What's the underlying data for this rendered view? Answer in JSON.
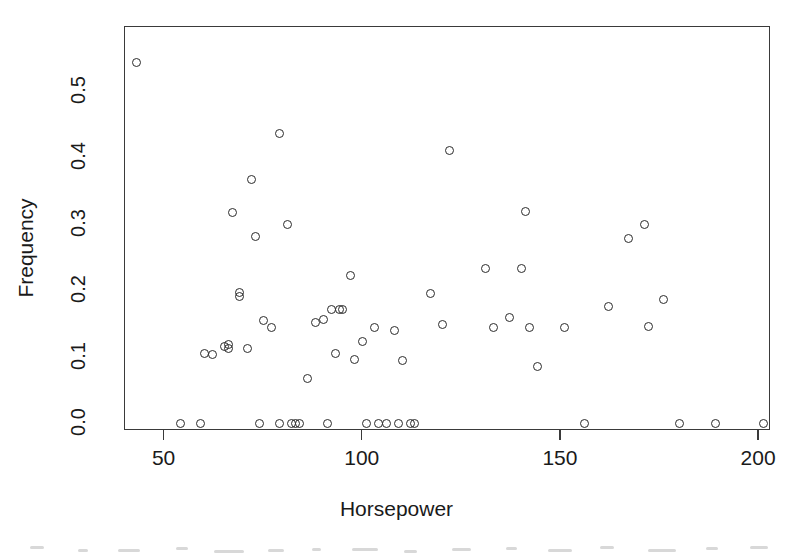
{
  "chart_data": {
    "type": "scatter",
    "title": "",
    "xlabel": "Horsepower",
    "ylabel": "Frequency",
    "xlim": [
      40,
      203
    ],
    "ylim": [
      -0.012,
      0.596
    ],
    "xticks": [
      50,
      100,
      150,
      200
    ],
    "xtick_labels": [
      "50",
      "100",
      "150",
      "200"
    ],
    "yticks": [
      0.0,
      0.1,
      0.2,
      0.3,
      0.4,
      0.5
    ],
    "ytick_labels": [
      "0.0",
      "0.1",
      "0.2",
      "0.3",
      "0.4",
      "0.5"
    ],
    "grid": false,
    "legend": null,
    "marker": "open-circle",
    "marker_color": "#2b2b2b",
    "series": [
      {
        "name": "Horsepower vs Frequency",
        "points": [
          [
            43,
            0.543
          ],
          [
            54,
            0.0
          ],
          [
            59,
            0.0
          ],
          [
            60,
            0.105
          ],
          [
            62,
            0.103
          ],
          [
            65,
            0.115
          ],
          [
            66,
            0.118
          ],
          [
            66,
            0.112
          ],
          [
            67,
            0.317
          ],
          [
            69,
            0.197
          ],
          [
            69,
            0.191
          ],
          [
            71,
            0.112
          ],
          [
            72,
            0.367
          ],
          [
            73,
            0.281
          ],
          [
            74,
            0.0
          ],
          [
            75,
            0.155
          ],
          [
            77,
            0.144
          ],
          [
            79,
            0.435
          ],
          [
            79,
            0.0
          ],
          [
            81,
            0.299
          ],
          [
            82,
            0.0
          ],
          [
            83,
            0.0
          ],
          [
            84,
            0.0
          ],
          [
            86,
            0.067
          ],
          [
            88,
            0.151
          ],
          [
            90,
            0.156
          ],
          [
            91,
            0.0
          ],
          [
            92,
            0.171
          ],
          [
            93,
            0.104
          ],
          [
            94,
            0.171
          ],
          [
            95,
            0.171
          ],
          [
            97,
            0.222
          ],
          [
            98,
            0.096
          ],
          [
            100,
            0.122
          ],
          [
            101,
            0.0
          ],
          [
            103,
            0.144
          ],
          [
            104,
            0.0
          ],
          [
            106,
            0.0
          ],
          [
            108,
            0.139
          ],
          [
            109,
            0.0
          ],
          [
            110,
            0.094
          ],
          [
            112,
            0.0
          ],
          [
            113,
            0.0
          ],
          [
            117,
            0.195
          ],
          [
            120,
            0.148
          ],
          [
            122,
            0.41
          ],
          [
            131,
            0.232
          ],
          [
            133,
            0.144
          ],
          [
            137,
            0.159
          ],
          [
            140,
            0.232
          ],
          [
            141,
            0.318
          ],
          [
            142,
            0.144
          ],
          [
            144,
            0.085
          ],
          [
            151,
            0.144
          ],
          [
            156,
            0.0
          ],
          [
            162,
            0.176
          ],
          [
            167,
            0.278
          ],
          [
            171,
            0.299
          ],
          [
            172,
            0.145
          ],
          [
            176,
            0.186
          ],
          [
            180,
            0.0
          ],
          [
            189,
            0.0
          ],
          [
            201,
            0.0
          ]
        ]
      }
    ]
  }
}
